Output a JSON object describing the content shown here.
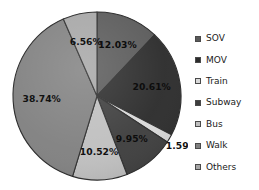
{
  "chart_data": {
    "type": "pie",
    "title": "",
    "subtitle": "",
    "xlabel": "",
    "ylabel": "",
    "grid": false,
    "legend_position": "right",
    "start_angle_deg": 0,
    "direction": "clockwise",
    "labels_format": "percent",
    "categories": [
      "SOV",
      "MOV",
      "Train",
      "Subway",
      "Bus",
      "Walk",
      "Others"
    ],
    "values": [
      12.03,
      20.61,
      1.59,
      9.95,
      10.52,
      38.74,
      6.56
    ],
    "value_labels": [
      "12.03%",
      "20.61%",
      "1.59%",
      "9.95%",
      "10.52%",
      "38.74%",
      "6.56%"
    ],
    "colors": [
      "#595959",
      "#2b2b2b",
      "#d9d9d9",
      "#3d3d3d",
      "#bfbfbf",
      "#808080",
      "#a6a6a6"
    ],
    "slices": [
      {
        "name": "SOV",
        "value": 12.03,
        "label": "12.03%",
        "color": "#595959",
        "label_inside": true,
        "label_tone": "on-dark"
      },
      {
        "name": "MOV",
        "value": 20.61,
        "label": "20.61%",
        "color": "#2b2b2b",
        "label_inside": true,
        "label_tone": "on-dark"
      },
      {
        "name": "Train",
        "value": 1.59,
        "label": "1.59%",
        "color": "#d9d9d9",
        "label_inside": false,
        "label_tone": "outside"
      },
      {
        "name": "Subway",
        "value": 9.95,
        "label": "9.95%",
        "color": "#3d3d3d",
        "label_inside": true,
        "label_tone": "on-dark"
      },
      {
        "name": "Bus",
        "value": 10.52,
        "label": "10.52%",
        "color": "#bfbfbf",
        "label_inside": true,
        "label_tone": "on-light"
      },
      {
        "name": "Walk",
        "value": 38.74,
        "label": "38.74%",
        "color": "#808080",
        "label_inside": true,
        "label_tone": "on-light"
      },
      {
        "name": "Others",
        "value": 6.56,
        "label": "6.56%",
        "color": "#a6a6a6",
        "label_inside": true,
        "label_tone": "on-light"
      }
    ]
  },
  "legend": {
    "items": [
      {
        "label": "SOV",
        "color": "#595959"
      },
      {
        "label": "MOV",
        "color": "#2b2b2b"
      },
      {
        "label": "Train",
        "color": "#d9d9d9"
      },
      {
        "label": "Subway",
        "color": "#3d3d3d"
      },
      {
        "label": "Bus",
        "color": "#bfbfbf"
      },
      {
        "label": "Walk",
        "color": "#808080"
      },
      {
        "label": "Others",
        "color": "#a6a6a6"
      }
    ]
  }
}
